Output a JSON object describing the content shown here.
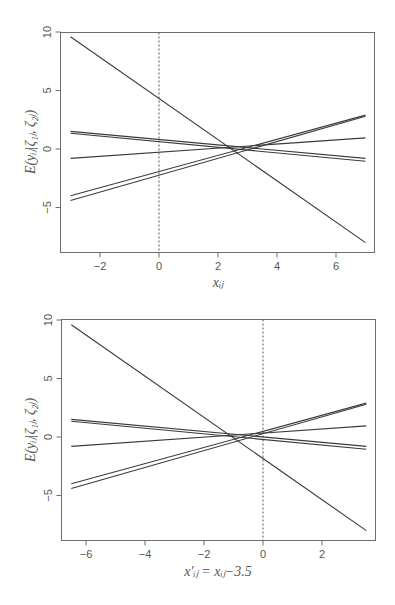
{
  "chart_data": [
    {
      "type": "line",
      "title": "",
      "xlabel": "x_ij",
      "ylabel": "E(y_ij | ζ_1j, ζ_2j)",
      "xlim": [
        -3.5,
        7.5
      ],
      "ylim": [
        -8.8,
        10
      ],
      "xticks": [
        -2,
        0,
        2,
        4,
        6
      ],
      "yticks": [
        -5,
        0,
        5,
        10
      ],
      "reference_line": {
        "x": 0,
        "style": "dashed"
      },
      "grid": false,
      "series": [
        {
          "name": "cluster 1",
          "x": [
            -3,
            7
          ],
          "values": [
            9.6,
            -8.0
          ]
        },
        {
          "name": "cluster 2",
          "x": [
            -3,
            7
          ],
          "values": [
            1.5,
            -0.8
          ]
        },
        {
          "name": "cluster 3",
          "x": [
            -3,
            7
          ],
          "values": [
            1.35,
            -1.05
          ]
        },
        {
          "name": "cluster 4",
          "x": [
            -3,
            7
          ],
          "values": [
            -0.8,
            0.95
          ]
        },
        {
          "name": "cluster 5",
          "x": [
            -3,
            7
          ],
          "values": [
            -4.0,
            2.9
          ]
        },
        {
          "name": "cluster 6",
          "x": [
            -3,
            7
          ],
          "values": [
            -4.4,
            2.8
          ]
        }
      ]
    },
    {
      "type": "line",
      "title": "",
      "xlabel": "x'_ij = x_ij − 3.5",
      "ylabel": "E(y_ij | ζ_1j, ζ_2j)",
      "xlim": [
        -7.0,
        4.0
      ],
      "ylim": [
        -8.8,
        10
      ],
      "xticks": [
        -6,
        -4,
        -2,
        0,
        2
      ],
      "yticks": [
        -5,
        0,
        5,
        10
      ],
      "reference_line": {
        "x": 0,
        "style": "dashed"
      },
      "grid": false,
      "series": [
        {
          "name": "cluster 1",
          "x": [
            -6.5,
            3.5
          ],
          "values": [
            9.6,
            -8.0
          ]
        },
        {
          "name": "cluster 2",
          "x": [
            -6.5,
            3.5
          ],
          "values": [
            1.5,
            -0.8
          ]
        },
        {
          "name": "cluster 3",
          "x": [
            -6.5,
            3.5
          ],
          "values": [
            1.35,
            -1.05
          ]
        },
        {
          "name": "cluster 4",
          "x": [
            -6.5,
            3.5
          ],
          "values": [
            -0.8,
            0.95
          ]
        },
        {
          "name": "cluster 5",
          "x": [
            -6.5,
            3.5
          ],
          "values": [
            -4.0,
            2.9
          ]
        },
        {
          "name": "cluster 6",
          "x": [
            -6.5,
            3.5
          ],
          "values": [
            -4.4,
            2.8
          ]
        }
      ]
    }
  ],
  "plots": [
    {
      "ylabel_main": "E(y",
      "ylabel_text": "E(yᵢⱼ|ζ₁ⱼ, ζ₂ⱼ)",
      "xlabel_text": "xᵢⱼ",
      "xtick_labels": [
        "-2",
        "0",
        "2",
        "4",
        "6"
      ],
      "ytick_labels": [
        "-5",
        "0",
        "5",
        "10"
      ]
    },
    {
      "ylabel_text": "E(yᵢⱼ|ζ₁ⱼ, ζ₂ⱼ)",
      "xlabel_text": "x′ᵢⱼ = xᵢⱼ−3.5",
      "xtick_labels": [
        "-6",
        "-4",
        "-2",
        "0",
        "2"
      ],
      "ytick_labels": [
        "-5",
        "0",
        "5",
        "10"
      ]
    }
  ]
}
